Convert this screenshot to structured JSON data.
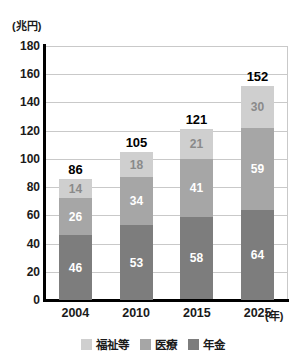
{
  "chart_data": {
    "type": "bar",
    "subtype": "stacked-bar",
    "title": "",
    "xlabel": "(年)",
    "ylabel": "(兆円)",
    "unit_label": "(兆円)",
    "year_unit_label": "(年)",
    "categories": [
      "2004",
      "2010",
      "2015",
      "2025"
    ],
    "ylim": [
      0,
      180
    ],
    "yticks": [
      0,
      20,
      40,
      60,
      80,
      100,
      120,
      140,
      160,
      180
    ],
    "ytick_labels": [
      "0",
      "20",
      "40",
      "60",
      "80",
      "100",
      "120",
      "140",
      "160",
      "180"
    ],
    "grid": true,
    "legend_position": "bottom",
    "series": [
      {
        "name": "年金",
        "key": "pension",
        "color": "#7d7d7d",
        "values": [
          46,
          53,
          58,
          64
        ]
      },
      {
        "name": "医療",
        "key": "medical",
        "color": "#a6a6a6",
        "values": [
          26,
          34,
          41,
          59
        ]
      },
      {
        "name": "福祉等",
        "key": "welfare",
        "color": "#cfcfcf",
        "values": [
          14,
          18,
          21,
          30
        ]
      }
    ],
    "totals": [
      86,
      105,
      121,
      152
    ],
    "stack_order_bottom_to_top": [
      "年金",
      "医療",
      "福祉等"
    ],
    "bars": [
      {
        "category": "2004",
        "total": 86,
        "pension": 46,
        "medical": 26,
        "welfare": 14
      },
      {
        "category": "2010",
        "total": 105,
        "pension": 53,
        "medical": 34,
        "welfare": 18
      },
      {
        "category": "2015",
        "total": 121,
        "pension": 58,
        "medical": 41,
        "welfare": 21
      },
      {
        "category": "2025",
        "total": 152,
        "pension": 64,
        "medical": 59,
        "welfare": 30
      }
    ]
  },
  "legend": {
    "items": [
      {
        "label": "福祉等",
        "color": "#cfcfcf"
      },
      {
        "label": "医療",
        "color": "#a6a6a6"
      },
      {
        "label": "年金",
        "color": "#7d7d7d"
      }
    ]
  },
  "colors": {
    "welfare": "#cfcfcf",
    "medical": "#a6a6a6",
    "pension": "#7d7d7d",
    "axis": "#000000",
    "grid": "#c9c9c9",
    "text": "#1a1a1a"
  }
}
